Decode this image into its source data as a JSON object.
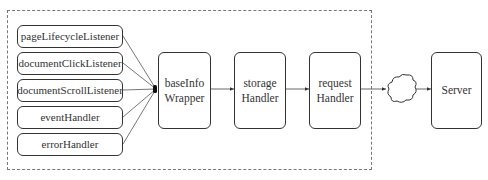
{
  "diagram": {
    "sources": [
      {
        "label": "pageLifecycleListener"
      },
      {
        "label": "documentClickListener"
      },
      {
        "label": "documentScrollListener"
      },
      {
        "label": "eventHandler"
      },
      {
        "label": "errorHandler"
      }
    ],
    "pipeline": [
      {
        "line1": "baseInfo",
        "line2": "Wrapper"
      },
      {
        "line1": "storage",
        "line2": "Handler"
      },
      {
        "line1": "request",
        "line2": "Handler"
      }
    ],
    "network": {
      "icon": "cloud-icon"
    },
    "server": {
      "label": "Server"
    },
    "boundary": "dashed-client-boundary"
  }
}
